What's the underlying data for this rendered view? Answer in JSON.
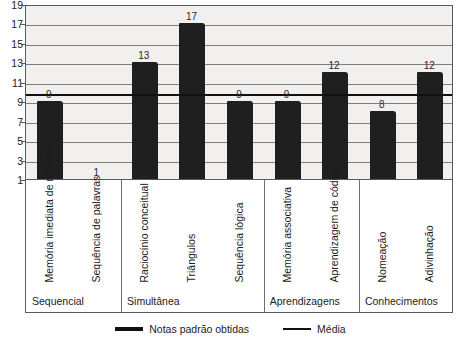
{
  "chart_data": {
    "type": "bar",
    "title": "",
    "subtitle": "",
    "xlabel": "",
    "ylabel": "",
    "ylim": [
      1,
      19
    ],
    "yticks": [
      1,
      3,
      5,
      7,
      9,
      11,
      13,
      15,
      17,
      19
    ],
    "grid": true,
    "legend_position": "bottom",
    "categories": [
      "Memória imediata de número",
      "Sequência de palavras",
      "Raciocínio conceitual",
      "Triângulos",
      "Sequência lógica",
      "Memória associativa",
      "Aprendizagem de código",
      "Nomeação",
      "Adivinhação"
    ],
    "values": [
      9,
      1,
      13,
      17,
      9,
      9,
      12,
      8,
      12
    ],
    "series": [
      {
        "name": "Notas padrão obtidas",
        "values": [
          9,
          1,
          13,
          17,
          9,
          9,
          12,
          8,
          12
        ],
        "color": "#201f1f"
      }
    ],
    "reference_line": {
      "name": "Média",
      "value": 10,
      "color": "#111111"
    },
    "groups": [
      {
        "label": "Sequencial",
        "categories": [
          "Memória imediata de número",
          "Sequência de palavras"
        ]
      },
      {
        "label": "Simultânea",
        "categories": [
          "Raciocínio conceitual",
          "Triângulos",
          "Sequência lógica"
        ]
      },
      {
        "label": "Aprendizagens",
        "categories": [
          "Memória associativa",
          "Aprendizagem de código"
        ]
      },
      {
        "label": "Conhecimentos",
        "categories": [
          "Nomeação",
          "Adivinhação"
        ]
      }
    ],
    "legend": [
      {
        "label": "Notas padrão obtidas",
        "marker": "thick-line"
      },
      {
        "label": "Média",
        "marker": "thin-line"
      }
    ]
  },
  "axis": {
    "y_tick_labels": [
      "1",
      "3",
      "5",
      "7",
      "9",
      "11",
      "13",
      "15",
      "17",
      "19"
    ]
  },
  "bar_value_labels": [
    "9",
    "1",
    "13",
    "17",
    "9",
    "9",
    "12",
    "8",
    "12"
  ],
  "category_labels": [
    "Memória imediata de número",
    "Sequência de palavras",
    "Raciocínio conceitual",
    "Triângulos",
    "Sequência lógica",
    "Memória associativa",
    "Aprendizagem de código",
    "Nomeação",
    "Adivinhação"
  ],
  "group_labels": [
    "Sequencial",
    "Simultânea",
    "Aprendizagens",
    "Conhecimentos"
  ],
  "legend_labels": [
    "Notas padrão obtidas",
    "Média"
  ]
}
